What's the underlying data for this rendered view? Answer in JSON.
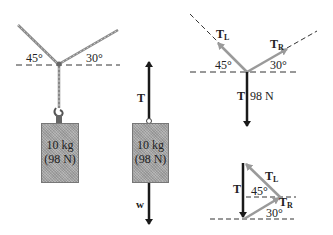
{
  "panels": {
    "physical": {
      "angle_left": "45°",
      "angle_right": "30°",
      "mass_label": "10 kg",
      "weight_label": "(98 N)"
    },
    "object_fbd": {
      "tension_label": "T",
      "mass_label": "10 kg",
      "weight_label": "(98 N)",
      "gravity_label": "w"
    },
    "knot_fbd": {
      "left_tension": "T",
      "left_sub": "L",
      "right_tension": "T",
      "right_sub": "R",
      "angle_left": "45°",
      "angle_right": "30°",
      "down_label": "T",
      "down_value": "98 N"
    },
    "vector_triangle": {
      "vertical_label": "T",
      "left_tension": "T",
      "left_sub": "L",
      "right_tension": "T",
      "right_sub": "R",
      "angle_upper": "45°",
      "angle_lower": "30°"
    }
  },
  "colors": {
    "rope": "#8a8a8a",
    "arrow_dark": "#1a1a1a",
    "arrow_gray": "#9a9a9a",
    "box_fill": "#a9a9a9",
    "dashed": "#333333"
  }
}
